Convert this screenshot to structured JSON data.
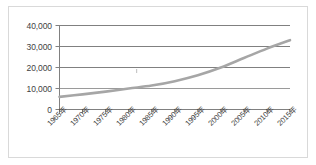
{
  "chart_data": {
    "type": "line",
    "title": "",
    "subtitle": "",
    "xlabel": "",
    "ylabel": "",
    "categories": [
      "1965年",
      "1970年",
      "1975年",
      "1980年",
      "1985年",
      "1990年",
      "1995年",
      "2000年",
      "2005年",
      "2010年",
      "2015年"
    ],
    "series": [
      {
        "name": "series-1",
        "values": [
          6000,
          7200,
          8500,
          10000,
          11400,
          13500,
          16300,
          20000,
          24500,
          29000,
          33000
        ],
        "color": "#a6a6a6"
      }
    ],
    "ylim": [
      0,
      40000
    ],
    "yticks": [
      0,
      10000,
      20000,
      30000,
      40000
    ],
    "ytick_labels": [
      "0",
      "10,000",
      "20,000",
      "30,000",
      "40,000"
    ],
    "grid": true,
    "grid_axis": "y",
    "grid_color": "#808080",
    "legend": false,
    "legend_position": "none",
    "axis_color": "#808080",
    "border_color": "#d9d9d9",
    "background": "#ffffff",
    "tick_label_rotation": -45
  },
  "axes": {
    "y_labels": [
      "40,000",
      "30,000",
      "20,000",
      "10,000",
      "0"
    ],
    "x_labels": [
      "1965年",
      "1970年",
      "1975年",
      "1980年",
      "1985年",
      "1990年",
      "1995年",
      "2000年",
      "2005年",
      "2010年",
      "2015年"
    ]
  }
}
